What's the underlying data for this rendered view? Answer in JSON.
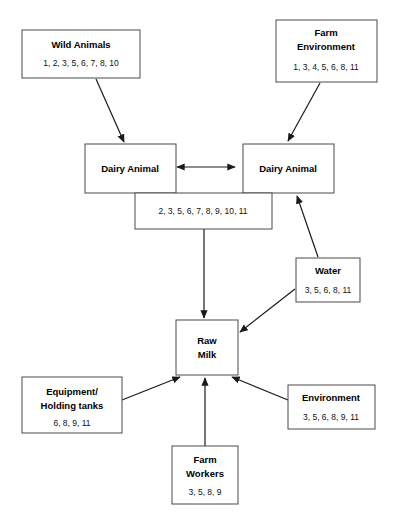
{
  "diagram": {
    "type": "flow-diagram",
    "title": "",
    "nodes": [
      {
        "id": "wild-animals",
        "label": "Wild Animals",
        "numbers": "1, 2, 3, 5, 6, 7, 8, 10"
      },
      {
        "id": "farm-environment",
        "label_line1": "Farm",
        "label_line2": "Environment",
        "numbers": "1, 3, 4, 5, 6, 8, 11"
      },
      {
        "id": "dairy-animal-left",
        "label": "Dairy Animal",
        "numbers": ""
      },
      {
        "id": "dairy-animal-right",
        "label": "Dairy Animal",
        "numbers": ""
      },
      {
        "id": "dairy-shared-numbers",
        "label": "",
        "numbers": "2, 3, 5, 6, 7, 8, 9, 10, 11"
      },
      {
        "id": "water",
        "label": "Water",
        "numbers": "3, 5, 6, 8, 11"
      },
      {
        "id": "raw-milk",
        "label_line1": "Raw",
        "label_line2": "Milk",
        "numbers": ""
      },
      {
        "id": "equipment-holding-tanks",
        "label_line1": "Equipment/",
        "label_line2": "Holding tanks",
        "numbers": "6, 8, 9, 11"
      },
      {
        "id": "environment",
        "label": "Environment",
        "numbers": "3, 5, 6, 8, 9, 11"
      },
      {
        "id": "farm-workers",
        "label_line1": "Farm",
        "label_line2": "Workers",
        "numbers": "3, 5, 8, 9"
      }
    ],
    "edges": [
      {
        "from": "wild-animals",
        "to": "dairy-animal-left",
        "style": "single-arrow"
      },
      {
        "from": "farm-environment",
        "to": "dairy-animal-right",
        "style": "single-arrow"
      },
      {
        "from": "dairy-animal-left",
        "to": "dairy-animal-right",
        "style": "double-arrow"
      },
      {
        "from": "water",
        "to": "dairy-animal-right",
        "style": "single-arrow"
      },
      {
        "from": "water",
        "to": "raw-milk",
        "style": "single-arrow"
      },
      {
        "from": "dairy-shared-numbers",
        "to": "raw-milk",
        "style": "single-arrow"
      },
      {
        "from": "equipment-holding-tanks",
        "to": "raw-milk",
        "style": "single-arrow"
      },
      {
        "from": "farm-workers",
        "to": "raw-milk",
        "style": "single-arrow"
      },
      {
        "from": "environment",
        "to": "raw-milk",
        "style": "single-arrow"
      }
    ],
    "colors": {
      "box_stroke": "#4a4a4a",
      "box_fill": "#ffffff",
      "line": "#1a1a1a",
      "text": "#000000",
      "background": "#ffffff"
    }
  }
}
